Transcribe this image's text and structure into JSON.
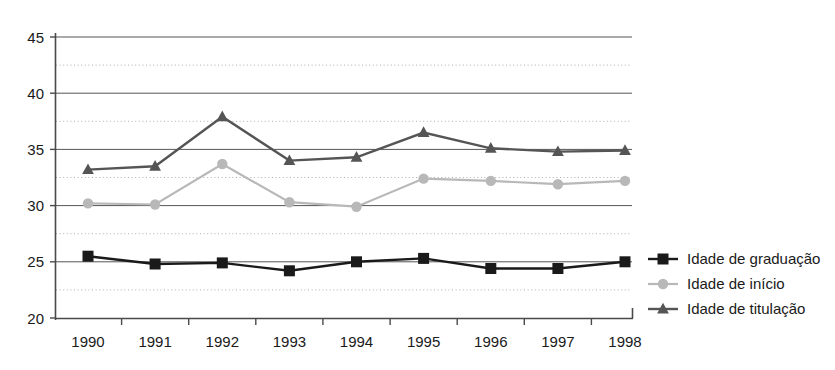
{
  "chart_data": {
    "type": "line",
    "title": "",
    "xlabel": "",
    "ylabel": "",
    "categories": [
      "1990",
      "1991",
      "1992",
      "1993",
      "1994",
      "1995",
      "1996",
      "1997",
      "1998"
    ],
    "ylim": [
      20,
      45
    ],
    "y_ticks": [
      "20",
      "25",
      "30",
      "35",
      "40",
      "45"
    ],
    "y_tick_values": [
      20,
      25,
      30,
      35,
      40,
      45
    ],
    "y_minor_values": [
      22.5,
      27.5,
      32.5,
      37.5,
      42.5
    ],
    "grid": "major solid, minor dotted",
    "legend_position": "right",
    "series": [
      {
        "name": "Idade de graduação",
        "marker": "square",
        "color": "#1a1a1a",
        "values": [
          25.5,
          24.8,
          24.9,
          24.2,
          25.0,
          25.3,
          24.4,
          24.4,
          25.0
        ]
      },
      {
        "name": "Idade  de início",
        "marker": "circle",
        "color": "#b8b8b8",
        "values": [
          30.2,
          30.1,
          33.7,
          30.3,
          29.9,
          32.4,
          32.2,
          31.9,
          32.2
        ]
      },
      {
        "name": "Idade  de titulação",
        "marker": "triangle",
        "color": "#555555",
        "values": [
          33.2,
          33.5,
          37.9,
          34.0,
          34.3,
          36.5,
          35.1,
          34.8,
          34.9
        ]
      }
    ]
  },
  "colors": {
    "graduacao": "#1a1a1a",
    "inicio": "#b8b8b8",
    "titulacao": "#555555",
    "grid_major": "#555555",
    "grid_minor": "#b9a9a9",
    "axis": "#4a4a4a",
    "background": "#ffffff"
  },
  "legend": {
    "items": [
      {
        "label": "Idade de graduação"
      },
      {
        "label": "Idade  de início"
      },
      {
        "label": "Idade  de titulação"
      }
    ]
  }
}
